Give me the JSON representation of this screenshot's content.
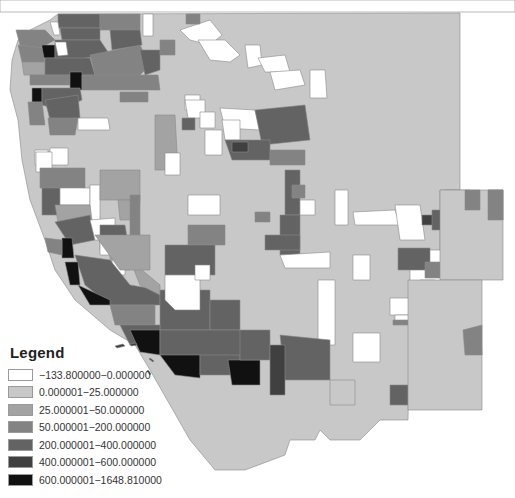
{
  "map": {
    "region": "Western United States (county-level choropleth)",
    "background": "#ffffff",
    "border_color": "#8a8a8a"
  },
  "legend": {
    "title": "Legend",
    "classes": [
      {
        "label": "−133.800000−0.000000",
        "color": "#ffffff"
      },
      {
        "label": "0.000001−25.000000",
        "color": "#c8c8c8"
      },
      {
        "label": "25.000001−50.000000",
        "color": "#a3a3a3"
      },
      {
        "label": "50.000001−200.000000",
        "color": "#838383"
      },
      {
        "label": "200.000001−400.000000",
        "color": "#636363"
      },
      {
        "label": "400.000001−600.000000",
        "color": "#404040"
      },
      {
        "label": "600.000001−1648.810000",
        "color": "#111111"
      }
    ]
  }
}
